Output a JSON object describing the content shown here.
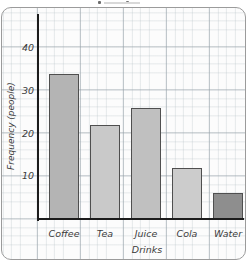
{
  "chart_data": {
    "type": "bar",
    "title": "",
    "categories": [
      "Coffee",
      "Tea",
      "Juice",
      "Cola",
      "Water"
    ],
    "values": [
      34,
      22,
      26,
      12,
      6
    ],
    "xlabel": "Drinks",
    "ylabel": "Frequency (people)",
    "yticks": [
      10,
      20,
      30,
      40
    ],
    "ylim": [
      0,
      47
    ],
    "grid": true,
    "legend": false,
    "bar_colors": [
      "#b4b4b4",
      "#c9c9c9",
      "#c0c0c0",
      "#cccccc",
      "#8e8e8e"
    ],
    "bar_border_color": "#4f4f4f",
    "axis_color": "#1c1c1c",
    "grid_color": "#aab4bb",
    "panel_border_color": "#9b9b9b"
  }
}
